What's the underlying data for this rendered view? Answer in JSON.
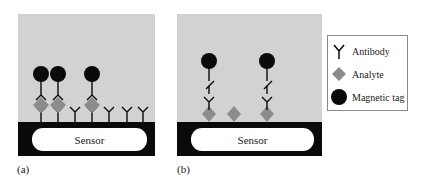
{
  "panels": {
    "a": {
      "label": "(a)",
      "sensor_label": "Sensor",
      "description": "Sandwich assay: antibodies bound to sensor; analyte captured and labeled by antibody-conjugated magnetic tags",
      "sites": [
        {
          "x": 23,
          "analyte": true,
          "tag": true
        },
        {
          "x": 40,
          "analyte": true,
          "tag": true
        },
        {
          "x": 57,
          "analyte": false,
          "tag": false
        },
        {
          "x": 74,
          "analyte": true,
          "tag": true
        },
        {
          "x": 91,
          "analyte": false,
          "tag": false
        },
        {
          "x": 109,
          "analyte": false,
          "tag": false
        },
        {
          "x": 125,
          "analyte": false,
          "tag": false
        }
      ]
    },
    "b": {
      "label": "(b)",
      "sensor_label": "Sensor",
      "description": "Competitive assay: analytes bound to sensor surface; antibody-linked magnetic tags bind free analyte sites",
      "analytes": [
        {
          "x": 32,
          "tag": true
        },
        {
          "x": 57,
          "tag": false
        },
        {
          "x": 90,
          "tag": true
        }
      ]
    }
  },
  "legend": {
    "items": [
      {
        "label": "Antibody",
        "icon": "antibody-icon"
      },
      {
        "label": "Analyte",
        "icon": "analyte-diamond-icon"
      },
      {
        "label": "Magnetic tag",
        "icon": "magnetic-tag-icon"
      }
    ]
  },
  "colors": {
    "background_panel": "#d2d2d2",
    "sensor_base": "#0a0a0a",
    "sensor": "#ffffff",
    "analyte": "#8c8c8c",
    "tag": "#0a0a0a",
    "antibody": "#0a0a0a"
  }
}
